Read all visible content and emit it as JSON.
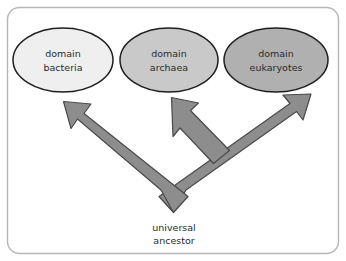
{
  "figure": {
    "panel": {
      "background_color": "#ffffff",
      "border_color": "#b7b7b7",
      "canvas_background": "#ffffff"
    },
    "nodes": [
      {
        "id": "bacteria",
        "label_line1": "domain",
        "label_line2": "bacteria",
        "fill_color": "#efefef",
        "stroke_color": "#1f1f1f",
        "cx": 63,
        "cy": 60,
        "rx": 50,
        "ry": 32
      },
      {
        "id": "archaea",
        "label_line1": "domain",
        "label_line2": "archaea",
        "fill_color": "#c9c9c9",
        "stroke_color": "#1f1f1f",
        "cx": 169,
        "cy": 60,
        "rx": 49,
        "ry": 32
      },
      {
        "id": "eukaryotes",
        "label_line1": "domain",
        "label_line2": "eukaryotes",
        "fill_color": "#b0b0b0",
        "stroke_color": "#1f1f1f",
        "cx": 276,
        "cy": 60,
        "rx": 52,
        "ry": 32
      }
    ],
    "root": {
      "id": "universal-ancestor",
      "label_line1": "universal",
      "label_line2": "ancestor",
      "x": 174,
      "y_line1": 228,
      "y_line2": 241
    },
    "arrows": {
      "fill_color": "#8d8d8d",
      "stroke_color": "#4a4a4a",
      "branches": [
        {
          "id": "arrow-to-bacteria",
          "from": "universal-ancestor",
          "to": "bacteria"
        },
        {
          "id": "arrow-to-archaea",
          "from": "universal-ancestor",
          "to": "archaea"
        },
        {
          "id": "arrow-to-eukaryotes",
          "from": "universal-ancestor",
          "to": "eukaryotes"
        }
      ]
    }
  }
}
